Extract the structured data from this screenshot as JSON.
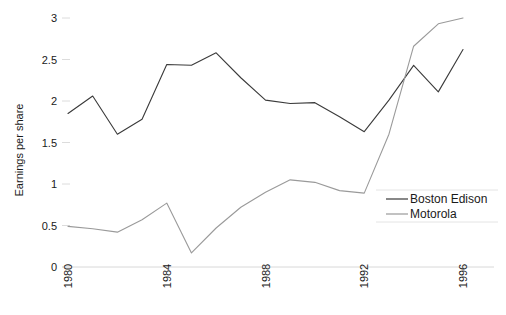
{
  "chart_data": {
    "type": "line",
    "title": "",
    "xlabel": "",
    "ylabel": "Earnings per share",
    "xlim": [
      1980,
      1996
    ],
    "ylim": [
      0,
      3
    ],
    "yticks": [
      "0",
      "0.5",
      "1",
      "1.5",
      "2",
      "2.5",
      "3"
    ],
    "ytick_values": [
      0,
      0.5,
      1,
      1.5,
      2,
      2.5,
      3
    ],
    "xticks": [
      "1980",
      "1984",
      "1988",
      "1992",
      "1996"
    ],
    "xtick_values": [
      1980,
      1984,
      1988,
      1992,
      1996
    ],
    "x": [
      1980,
      1981,
      1982,
      1983,
      1984,
      1985,
      1986,
      1987,
      1988,
      1989,
      1990,
      1991,
      1992,
      1993,
      1994,
      1995,
      1996
    ],
    "grid": false,
    "legend_position": "right-center",
    "series": [
      {
        "name": "Boston Edison",
        "color": "#3a3a3a",
        "values": [
          1.85,
          2.06,
          1.6,
          1.78,
          2.44,
          2.43,
          2.58,
          2.28,
          2.01,
          1.97,
          1.98,
          1.81,
          1.63,
          2.01,
          2.43,
          2.11,
          2.62
        ]
      },
      {
        "name": "Motorola",
        "color": "#9a9a9a",
        "values": [
          0.49,
          0.46,
          0.42,
          0.57,
          0.77,
          0.17,
          0.47,
          0.72,
          0.9,
          1.05,
          1.02,
          0.92,
          0.89,
          1.6,
          2.66,
          2.93,
          3.0
        ]
      }
    ]
  },
  "legend": {
    "items": [
      {
        "label": "Boston Edison"
      },
      {
        "label": "Motorola"
      }
    ]
  }
}
